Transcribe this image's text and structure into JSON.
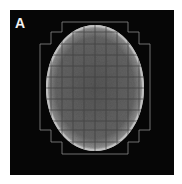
{
  "figure": {
    "panel_label": "A",
    "background_color": "#060606",
    "ellipse": {
      "cx": 95,
      "cy": 88,
      "rx": 49,
      "ry": 63,
      "fill": "#5c5c5c",
      "rim_color": "#bdbdbd"
    },
    "grid": {
      "line_color": "#8a8a8a",
      "cell_size": 11,
      "outline_points": "62,22 128,22 128,32 139,32 139,44 150,44 150,130 139,130 139,142 128,142 128,154 62,154 62,142 51,142 51,130 40,130 40,44 51,44 51,32 62,32"
    }
  }
}
